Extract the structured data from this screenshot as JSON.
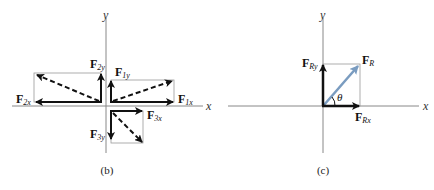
{
  "panel_b": {
    "caption": "(b)",
    "axis_x": "x",
    "axis_y": "y",
    "forces": [
      {
        "main": "F",
        "sub": "2y"
      },
      {
        "main": "F",
        "sub": "1y"
      },
      {
        "main": "F",
        "sub": "2x"
      },
      {
        "main": "F",
        "sub": "1x"
      },
      {
        "main": "F",
        "sub": "3x"
      },
      {
        "main": "F",
        "sub": "3y"
      }
    ]
  },
  "panel_c": {
    "caption": "(c)",
    "axis_x": "x",
    "axis_y": "y",
    "resultant": {
      "main": "F",
      "sub": "R"
    },
    "resultant_y": {
      "main": "F",
      "sub": "Ry"
    },
    "resultant_x": {
      "main": "F",
      "sub": "Rx"
    },
    "angle": "θ",
    "resultant_color": "#7a9cc0"
  }
}
